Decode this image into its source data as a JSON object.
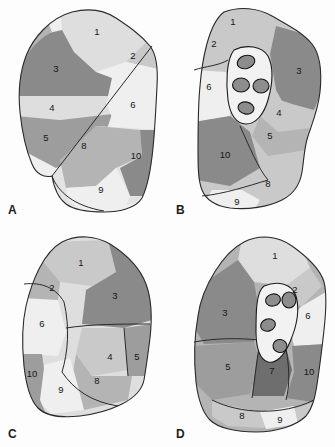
{
  "figure": {
    "background_color": "#fdfdfd",
    "outline_color": "#2a2a2a"
  },
  "palette": {
    "tone_lightest": "#efefef",
    "tone_light": "#dedede",
    "tone_mid_light": "#c9c9c9",
    "tone_mid": "#b4b4b4",
    "tone_mid_dark": "#9d9d9d",
    "tone_dark": "#8a8a8a",
    "tone_darkest": "#6e6e6e",
    "hilum_fill": "#f2f2f2",
    "vessel_fill": "#8d8d8d",
    "label_color": "#161616"
  },
  "panels": [
    {
      "id": "A",
      "label": "A",
      "has_hilum": false,
      "segments": [
        {
          "number": "1",
          "x": 97,
          "y": 32,
          "tone": "tone_light"
        },
        {
          "number": "2",
          "x": 133,
          "y": 56,
          "tone": "tone_mid_light"
        },
        {
          "number": "3",
          "x": 56,
          "y": 69,
          "tone": "tone_dark"
        },
        {
          "number": "4",
          "x": 52,
          "y": 108,
          "tone": "tone_light"
        },
        {
          "number": "5",
          "x": 46,
          "y": 138,
          "tone": "tone_mid_dark"
        },
        {
          "number": "6",
          "x": 133,
          "y": 105,
          "tone": "tone_lightest"
        },
        {
          "number": "8",
          "x": 84,
          "y": 146,
          "tone": "tone_mid"
        },
        {
          "number": "9",
          "x": 101,
          "y": 190,
          "tone": "tone_lightest"
        },
        {
          "number": "10",
          "x": 136,
          "y": 156,
          "tone": "tone_dark"
        }
      ]
    },
    {
      "id": "B",
      "label": "B",
      "has_hilum": true,
      "hilum_vessels": 4,
      "segments": [
        {
          "number": "1",
          "x": 65,
          "y": 22,
          "tone": "tone_mid_light"
        },
        {
          "number": "2",
          "x": 46,
          "y": 44,
          "tone": "tone_mid_light"
        },
        {
          "number": "3",
          "x": 131,
          "y": 71,
          "tone": "tone_dark"
        },
        {
          "number": "4",
          "x": 111,
          "y": 113,
          "tone": "tone_mid_light"
        },
        {
          "number": "5",
          "x": 102,
          "y": 136,
          "tone": "tone_mid"
        },
        {
          "number": "6",
          "x": 41,
          "y": 87,
          "tone": "tone_lightest"
        },
        {
          "number": "8",
          "x": 100,
          "y": 184,
          "tone": "tone_mid_light"
        },
        {
          "number": "9",
          "x": 69,
          "y": 202,
          "tone": "tone_lightest"
        },
        {
          "number": "10",
          "x": 57,
          "y": 155,
          "tone": "tone_dark"
        }
      ]
    },
    {
      "id": "C",
      "label": "C",
      "has_hilum": false,
      "segments": [
        {
          "number": "1",
          "x": 81,
          "y": 39,
          "tone": "tone_mid_light"
        },
        {
          "number": "2",
          "x": 52,
          "y": 64,
          "tone": "tone_mid"
        },
        {
          "number": "3",
          "x": 115,
          "y": 72,
          "tone": "tone_dark"
        },
        {
          "number": "4",
          "x": 110,
          "y": 133,
          "tone": "tone_mid_light"
        },
        {
          "number": "5",
          "x": 137,
          "y": 133,
          "tone": "tone_mid_dark"
        },
        {
          "number": "6",
          "x": 42,
          "y": 100,
          "tone": "tone_lightest"
        },
        {
          "number": "8",
          "x": 97,
          "y": 157,
          "tone": "tone_mid"
        },
        {
          "number": "9",
          "x": 61,
          "y": 166,
          "tone": "tone_lightest"
        },
        {
          "number": "10",
          "x": 32,
          "y": 150,
          "tone": "tone_mid_dark"
        }
      ]
    },
    {
      "id": "D",
      "label": "D",
      "has_hilum": true,
      "hilum_vessels": 4,
      "segments": [
        {
          "number": "1",
          "x": 107,
          "y": 32,
          "tone": "tone_light"
        },
        {
          "number": "2",
          "x": 127,
          "y": 66,
          "tone": "tone_mid_light"
        },
        {
          "number": "3",
          "x": 57,
          "y": 89,
          "tone": "tone_dark"
        },
        {
          "number": "5",
          "x": 60,
          "y": 143,
          "tone": "tone_mid_dark"
        },
        {
          "number": "6",
          "x": 140,
          "y": 92,
          "tone": "tone_lightest"
        },
        {
          "number": "7",
          "x": 104,
          "y": 147,
          "tone": "tone_darkest"
        },
        {
          "number": "8",
          "x": 74,
          "y": 192,
          "tone": "tone_mid_light"
        },
        {
          "number": "9",
          "x": 112,
          "y": 196,
          "tone": "tone_lightest"
        },
        {
          "number": "10",
          "x": 141,
          "y": 148,
          "tone": "tone_dark"
        }
      ]
    }
  ]
}
